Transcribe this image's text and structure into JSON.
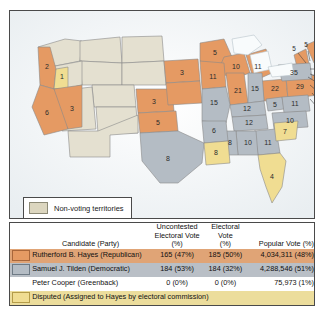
{
  "map": {
    "legend": {
      "swatch_name": "non-voting-territories-swatch",
      "label": "Non-voting territories"
    },
    "colors": {
      "hayes": "#e59a63",
      "tilden": "#b4bcc4",
      "disputed": "#f0dd92",
      "non_voting": "#dcd6bf",
      "water": "#ffffff",
      "border": "#4a4a4a"
    },
    "states": [
      {
        "abbr": "OR",
        "votes": "2",
        "party": "hayes"
      },
      {
        "abbr": "OR-disputed",
        "votes": "1",
        "party": "disputed"
      },
      {
        "abbr": "CA",
        "votes": "6",
        "party": "hayes"
      },
      {
        "abbr": "NV",
        "votes": "3",
        "party": "hayes"
      },
      {
        "abbr": "CO",
        "votes": "3",
        "party": "hayes"
      },
      {
        "abbr": "NE",
        "votes": "3",
        "party": "hayes"
      },
      {
        "abbr": "KS",
        "votes": "5",
        "party": "hayes"
      },
      {
        "abbr": "MN",
        "votes": "5",
        "party": "hayes"
      },
      {
        "abbr": "IA",
        "votes": "11",
        "party": "hayes"
      },
      {
        "abbr": "WI",
        "votes": "10",
        "party": "hayes"
      },
      {
        "abbr": "IL",
        "votes": "21",
        "party": "hayes"
      },
      {
        "abbr": "MI",
        "votes": "11",
        "party": "hayes"
      },
      {
        "abbr": "IN",
        "votes": "15",
        "party": "tilden"
      },
      {
        "abbr": "MO",
        "votes": "15",
        "party": "tilden"
      },
      {
        "abbr": "OH",
        "votes": "22",
        "party": "hayes"
      },
      {
        "abbr": "PA",
        "votes": "29",
        "party": "hayes"
      },
      {
        "abbr": "NY",
        "votes": "35",
        "party": "tilden"
      },
      {
        "abbr": "ME",
        "votes": "7",
        "party": "hayes"
      },
      {
        "abbr": "KY",
        "votes": "12",
        "party": "tilden"
      },
      {
        "abbr": "TN",
        "votes": "12",
        "party": "tilden"
      },
      {
        "abbr": "WV",
        "votes": "5",
        "party": "tilden"
      },
      {
        "abbr": "VA",
        "votes": "11",
        "party": "tilden"
      },
      {
        "abbr": "NC",
        "votes": "10",
        "party": "tilden"
      },
      {
        "abbr": "SC",
        "votes": "7",
        "party": "disputed"
      },
      {
        "abbr": "GA",
        "votes": "11",
        "party": "tilden"
      },
      {
        "abbr": "AL",
        "votes": "10",
        "party": "tilden"
      },
      {
        "abbr": "MS",
        "votes": "8",
        "party": "tilden"
      },
      {
        "abbr": "LA",
        "votes": "8",
        "party": "disputed"
      },
      {
        "abbr": "AR",
        "votes": "6",
        "party": "tilden"
      },
      {
        "abbr": "TX",
        "votes": "8",
        "party": "tilden"
      },
      {
        "abbr": "FL",
        "votes": "4",
        "party": "disputed"
      }
    ],
    "leader_labels": [
      {
        "abbr": "VT",
        "votes": "5"
      },
      {
        "abbr": "NH",
        "votes": "5"
      },
      {
        "abbr": "MA",
        "votes": "13"
      },
      {
        "abbr": "RI",
        "votes": "4"
      },
      {
        "abbr": "CT",
        "votes": "6"
      },
      {
        "abbr": "NJ",
        "votes": "9"
      },
      {
        "abbr": "DE",
        "votes": "3"
      },
      {
        "abbr": "MD",
        "votes": "8"
      }
    ]
  },
  "table": {
    "headers": {
      "candidate": "Candidate (Party)",
      "uncontested_line1": "Uncontested",
      "uncontested_line2": "Electoral Vote",
      "uncontested_line3": "(%)",
      "electoral_line1": "Electoral",
      "electoral_line2": "Vote",
      "electoral_line3": "(%)",
      "popular": "Popular Vote (%)"
    },
    "rows": [
      {
        "swatch": "hayes-swatch",
        "candidate": "Rutherford B. Hayes (Republican)",
        "uncontested": "165 (47%)",
        "electoral": "185 (50%)",
        "popular": "4,034,311 (48%)"
      },
      {
        "swatch": "tilden-swatch",
        "candidate": "Samuel J. Tilden (Democratic)",
        "uncontested": "184 (53%)",
        "electoral": "184 (32%)",
        "popular": "4,288,546 (51%)"
      },
      {
        "swatch": "none",
        "candidate": "Peter Cooper (Greenback)",
        "uncontested": "0 (0%)",
        "electoral": "0 (0%)",
        "popular": "75,973 (1%)"
      }
    ],
    "disputed_row": {
      "swatch": "disputed-swatch",
      "label": "Disputed (Assigned to Hayes by electoral commission)"
    }
  }
}
